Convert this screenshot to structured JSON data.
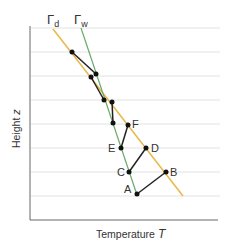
{
  "title": "",
  "axes": {
    "xlabel": "Temperature",
    "xvar": "T",
    "ylabel": "Height",
    "yvar": "z"
  },
  "lines": {
    "dry": {
      "label": "Γ",
      "sub": "d",
      "color": "#e8b84a"
    },
    "wet": {
      "label": "Γ",
      "sub": "w",
      "color": "#6aaa6a"
    }
  },
  "points": {
    "A": "A",
    "B": "B",
    "C": "C",
    "D": "D",
    "E": "E",
    "F": "F"
  },
  "colors": {
    "grid": "#dddddd",
    "axis": "#555555",
    "path": "#222222"
  }
}
